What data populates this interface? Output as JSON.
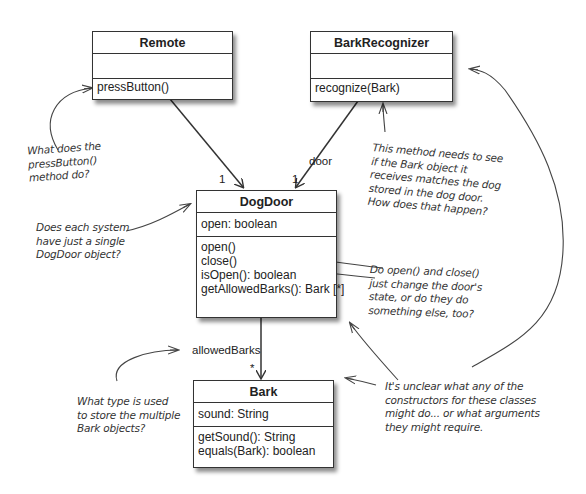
{
  "classes": {
    "remote": {
      "name": "Remote",
      "attributes": [],
      "methods": [
        "pressButton()"
      ]
    },
    "bark_recognizer": {
      "name": "BarkRecognizer",
      "attributes": [],
      "methods": [
        "recognize(Bark)"
      ]
    },
    "dog_door": {
      "name": "DogDoor",
      "attributes": [
        "open: boolean"
      ],
      "methods": [
        "open()",
        "close()",
        "isOpen(): boolean",
        "getAllowedBarks(): Bark [*]"
      ]
    },
    "bark": {
      "name": "Bark",
      "attributes": [
        "sound: String"
      ],
      "methods": [
        "getSound(): String",
        "equals(Bark): boolean"
      ]
    }
  },
  "associations": {
    "remote_to_dogdoor": {
      "multiplicity": "1"
    },
    "recognizer_to_dogdoor": {
      "role": "door",
      "multiplicity": "1"
    },
    "dogdoor_to_bark": {
      "role": "allowedBarks",
      "multiplicity": "*"
    }
  },
  "notes": {
    "press_button": [
      "What does the",
      "pressButton()",
      "method do?"
    ],
    "single_dogdoor": [
      "Does each system",
      "have just a single",
      "DogDoor object?"
    ],
    "recognize": [
      "This method needs to see",
      "if the Bark object it",
      "receives matches the dog",
      "stored in the dog door.",
      "How does that happen?"
    ],
    "open_close": [
      "Do open() and close()",
      "just change the door's",
      "state, or do they do",
      "something else, too?"
    ],
    "bark_type": [
      "What type is used",
      "to store the multiple",
      "Bark objects?"
    ],
    "constructors": [
      "It's unclear what any of the",
      "constructors for these classes",
      "might do... or what arguments",
      "they might require."
    ]
  }
}
